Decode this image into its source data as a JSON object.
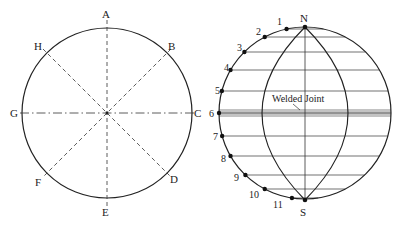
{
  "figure": {
    "left": {
      "title": "circle-division",
      "points": [
        {
          "label": "A",
          "x": 106,
          "y": 18
        },
        {
          "label": "B",
          "x": 172,
          "y": 50
        },
        {
          "label": "C",
          "x": 198,
          "y": 117
        },
        {
          "label": "D",
          "x": 174,
          "y": 183
        },
        {
          "label": "E",
          "x": 106,
          "y": 216
        },
        {
          "label": "F",
          "x": 39,
          "y": 186
        },
        {
          "label": "G",
          "x": 14,
          "y": 117
        },
        {
          "label": "H",
          "x": 38,
          "y": 50
        }
      ]
    },
    "right": {
      "top_label": "N",
      "bottom_label": "S",
      "joint_label": "Welded Joint",
      "points": [
        {
          "label": "1",
          "x": 281,
          "y": 25
        },
        {
          "label": "2",
          "x": 260,
          "y": 35
        },
        {
          "label": "3",
          "x": 241,
          "y": 51
        },
        {
          "label": "4",
          "x": 228,
          "y": 71
        },
        {
          "label": "5",
          "x": 219,
          "y": 94
        },
        {
          "label": "6",
          "x": 213,
          "y": 117
        },
        {
          "label": "7",
          "x": 217,
          "y": 140
        },
        {
          "label": "8",
          "x": 225,
          "y": 162
        },
        {
          "label": "9",
          "x": 238,
          "y": 181
        },
        {
          "label": "10",
          "x": 253,
          "y": 198
        },
        {
          "label": "11",
          "x": 277,
          "y": 208
        }
      ]
    }
  }
}
